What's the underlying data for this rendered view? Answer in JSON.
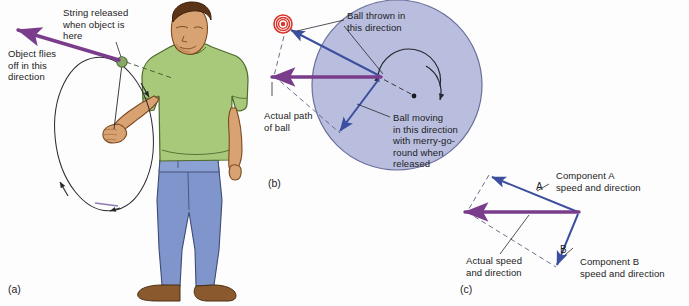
{
  "figure": {
    "background": "#fdfdfd"
  },
  "colors": {
    "purple_arrow": "#7a3d8c",
    "blue_arrow": "#3b4f9e",
    "merry_go_round_fill": "#b9bede",
    "merry_go_round_stroke": "#6b6f9c",
    "target_red": "#d8342a",
    "shirt_green": "#a8c97a",
    "pants_blue": "#7f95cc",
    "skin": "#d9a273",
    "hair_brown": "#5a3318",
    "shoe_brown": "#8a5a2e",
    "ball_green": "#8aa86a",
    "line_black": "#27272e",
    "text": "#1b1b23"
  },
  "panel_a": {
    "id": "(a)",
    "labels": {
      "object_flies": "Object flies\noff in this\ndirection",
      "object_flies_lines": [
        "Object flies",
        "off in this",
        "direction"
      ],
      "string_released": "String released\nwhen object is\nhere",
      "string_released_lines": [
        "String released",
        "when object is",
        "here"
      ]
    },
    "elements": {
      "person": "man swinging object on a string",
      "circle_path": "elliptical path of whirling object",
      "release_point": "green ball at release point",
      "velocity_arrow": "purple tangent arrow"
    }
  },
  "panel_b": {
    "id": "(b)",
    "labels": {
      "ball_thrown": "Ball thrown in\nthis direction",
      "ball_thrown_lines": [
        "Ball thrown in",
        "this direction"
      ],
      "actual_path": "Actual path\nof ball",
      "actual_path_lines": [
        "Actual path",
        "of ball"
      ],
      "ball_moving": "Ball moving\nin this direction\nwith merry-go-\nround when\nreleased",
      "ball_moving_lines": [
        "Ball moving",
        "in this direction",
        "with merry-go-",
        "round when",
        "released"
      ]
    },
    "elements": {
      "merry_go_round": "large shaded rotating disc",
      "target": "red bullseye target",
      "rotation_arc": "curved arrow showing rotation",
      "resultant_arrow": "purple horizontal resultant arrow",
      "component_arrows": "blue component vectors",
      "construction_lines": "dashed parallelogram lines"
    }
  },
  "panel_c": {
    "id": "(c)",
    "labels": {
      "component_a": "Component A\nspeed and direction",
      "component_a_lines": [
        "Component A",
        "speed and direction"
      ],
      "component_b": "Component B\nspeed and direction",
      "component_b_lines": [
        "Component B",
        "speed and direction"
      ],
      "actual_speed": "Actual speed\nand direction",
      "actual_speed_lines": [
        "Actual speed",
        "and direction"
      ],
      "vector_a": "A",
      "vector_b": "B"
    },
    "elements": {
      "resultant_arrow": "purple resultant arrow",
      "component_arrows": "blue component vectors A and B",
      "construction_lines": "dashed parallelogram completion lines"
    }
  }
}
